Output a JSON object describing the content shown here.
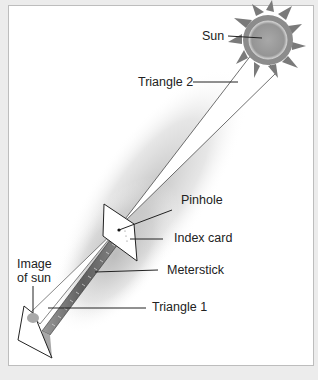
{
  "diagram": {
    "labels": {
      "sun": "Sun",
      "triangle2": "Triangle 2",
      "pinhole": "Pinhole",
      "index_card": "Index card",
      "meterstick": "Meterstick",
      "image_of_sun_line1": "Image",
      "image_of_sun_line2": "of sun",
      "triangle1": "Triangle 1"
    },
    "colors": {
      "background": "#ececec",
      "frame": "#ffffff",
      "shadow": "#b8b8b8",
      "sun_body": "#9a9a9a",
      "sun_flames": "#7a7a7a",
      "line": "#222222"
    }
  }
}
